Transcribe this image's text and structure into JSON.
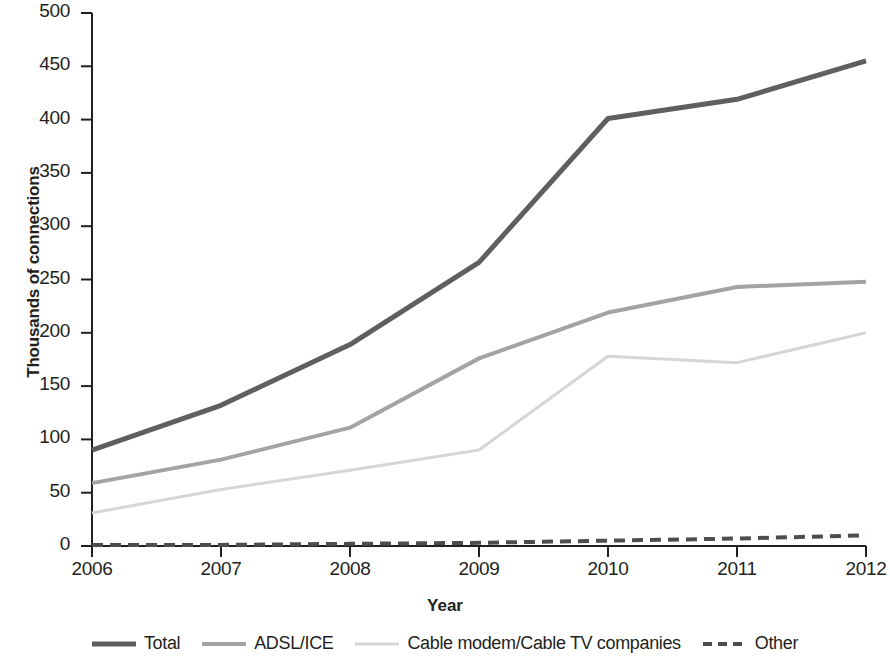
{
  "chart_data": {
    "type": "line",
    "title": "",
    "xlabel": "Year",
    "ylabel": "Thousands of connections",
    "x": [
      2006,
      2007,
      2008,
      2009,
      2010,
      2011,
      2012
    ],
    "xticklabels": [
      "2006",
      "2007",
      "2008",
      "2009",
      "2010",
      "2011",
      "2012"
    ],
    "yticklabels": [
      "0",
      "50",
      "100",
      "150",
      "200",
      "250",
      "300",
      "350",
      "400",
      "450",
      "500"
    ],
    "yticks": [
      0,
      50,
      100,
      150,
      200,
      250,
      300,
      350,
      400,
      450,
      500
    ],
    "ylim": [
      0,
      500
    ],
    "xlim": [
      2006,
      2012
    ],
    "grid": false,
    "legend_position": "bottom",
    "series": [
      {
        "name": "Total",
        "values": [
          90,
          132,
          189,
          266,
          401,
          419,
          455
        ],
        "color": "#5f5f5f",
        "style": "solid",
        "width": 5
      },
      {
        "name": "ADSL/ICE",
        "values": [
          59,
          81,
          111,
          176,
          219,
          243,
          248
        ],
        "color": "#a3a3a3",
        "style": "solid",
        "width": 4
      },
      {
        "name": "Cable modem/Cable TV companies",
        "values": [
          31,
          53,
          71,
          90,
          178,
          172,
          200
        ],
        "color": "#d6d6d6",
        "style": "solid",
        "width": 3
      },
      {
        "name": "Other",
        "values": [
          1,
          1,
          2,
          3,
          5,
          7,
          10
        ],
        "color": "#4d4d4d",
        "style": "dashed",
        "width": 4
      }
    ]
  },
  "axis": {
    "y_title": "Thousands of connections",
    "x_title": "Year"
  },
  "legend": {
    "items": [
      {
        "label": "Total"
      },
      {
        "label": "ADSL/ICE"
      },
      {
        "label": "Cable modem/Cable TV companies"
      },
      {
        "label": "Other"
      }
    ]
  }
}
